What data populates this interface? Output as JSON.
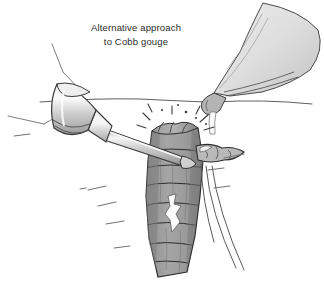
{
  "figure": {
    "kind": "medical-surgical-illustration",
    "caption": {
      "line1": "Alternative approach",
      "line2": "to Cobb gouge"
    },
    "palette": {
      "background": "#ffffff",
      "outline": "#3a3a3a",
      "text": "#2b2b2b",
      "bone_dark": "#8c8c8c",
      "bone_mid": "#a0a0a0",
      "bone_light": "#c4c4c4",
      "bone_highlight": "#f2f2f2",
      "metal_light": "#e6e6e6",
      "metal_mid": "#c9c9c9",
      "metal_dark": "#9a9a9a",
      "tissue_line": "#6e6e6e"
    },
    "labels": {
      "cobb_gouge": "Cobb gouge",
      "retractor_blade": "retractor blade",
      "vertebral_body": "vertebral body",
      "disc_space": "disc space",
      "nerve_roots": "nerve roots",
      "soft_tissue": "soft tissue",
      "impact_marks": "impact marks"
    }
  }
}
